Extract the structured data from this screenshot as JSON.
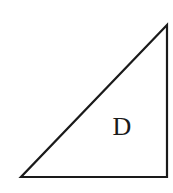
{
  "diagram": {
    "shape": "right-triangle",
    "vertices": {
      "top_right": [
        167,
        25
      ],
      "bottom_left": [
        21,
        177
      ],
      "bottom_right": [
        167,
        177
      ]
    },
    "label": "D",
    "label_position": [
      122,
      132
    ],
    "stroke_color": "#1a1a1a",
    "fill_color": "#ffffff",
    "stroke_width": 2.2
  }
}
